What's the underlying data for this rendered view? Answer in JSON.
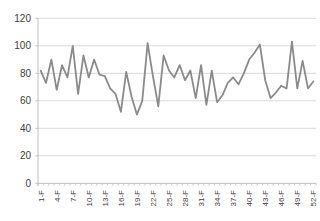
{
  "chart_data": {
    "type": "line",
    "title": "",
    "xlabel": "",
    "ylabel": "",
    "values": [
      82,
      73,
      90,
      68,
      86,
      77,
      100,
      65,
      93,
      77,
      90,
      79,
      78,
      69,
      65,
      52,
      81,
      63,
      50,
      60,
      102,
      78,
      56,
      93,
      82,
      77,
      86,
      75,
      82,
      62,
      86,
      57,
      82,
      59,
      64,
      73,
      77,
      72,
      80,
      90,
      95,
      101,
      75,
      62,
      66,
      71,
      69,
      103,
      69,
      89,
      69,
      74
    ],
    "num_points": 52,
    "x_tick_labels": [
      "1-F",
      "4-F",
      "7-F",
      "10-F",
      "13-F",
      "16-F",
      "19-F",
      "22-F",
      "25-F",
      "28-F",
      "31-F",
      "34-F",
      "37-F",
      "40-F",
      "43-F",
      "46-F",
      "49-F",
      "52-F"
    ],
    "x_label_every": 3,
    "x_labels_rotated_degrees": -90,
    "y_ticks": [
      0,
      20,
      40,
      60,
      80,
      100,
      120
    ],
    "ylim": [
      0,
      120
    ],
    "grid": "horizontal",
    "legend": "none",
    "colors": {
      "line": "#8b8b8b",
      "grid": "#d9d9d9",
      "axis": "#c0c0c0",
      "text": "#404040",
      "background": "#ffffff"
    }
  }
}
